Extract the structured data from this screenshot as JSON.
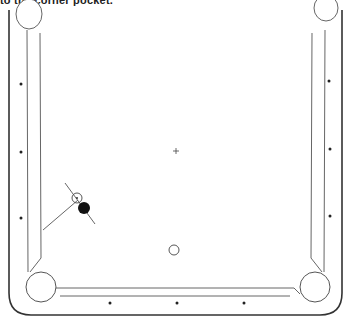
{
  "caption": "to the corner pocket.",
  "diagram": {
    "type": "billiard-table",
    "colors": {
      "line": "#333333",
      "rail": "#555555",
      "ball_object": "#111111",
      "background": "#ffffff"
    },
    "diamonds": {
      "left": [
        [
          21,
          84
        ],
        [
          21,
          152
        ],
        [
          21,
          218
        ]
      ],
      "right": [
        [
          329,
          81
        ],
        [
          330,
          149
        ],
        [
          330,
          216
        ]
      ],
      "bottom": [
        [
          110,
          303
        ],
        [
          177,
          303
        ],
        [
          244,
          303
        ]
      ]
    },
    "center_spot": [
      176,
      151
    ],
    "cue_ball": {
      "x": 174,
      "y": 250,
      "r": 5
    },
    "object_ball": {
      "x": 84,
      "y": 208,
      "r": 6
    },
    "ghost_ball": {
      "x": 77,
      "y": 198,
      "r": 5
    },
    "aim_line": {
      "from": [
        65,
        183
      ],
      "to": [
        95,
        224
      ]
    },
    "path_line": {
      "from": [
        43,
        230
      ],
      "to": [
        78,
        200
      ]
    }
  }
}
